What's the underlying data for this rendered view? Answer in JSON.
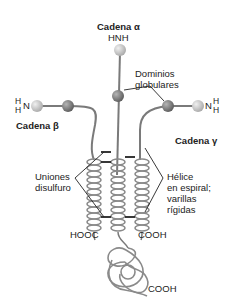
{
  "diagram": {
    "chains": {
      "alpha": {
        "label": "Cadena α",
        "terminal": "HNH"
      },
      "beta": {
        "label": "Cadena β",
        "terminal_h1": "H",
        "terminal_n": "N",
        "terminal_h2": "H"
      },
      "gamma": {
        "label": "Cadena γ",
        "terminal_n": "N",
        "terminal_h1": "H",
        "terminal_h2": "H"
      }
    },
    "annotations": {
      "globular": {
        "line1": "Dominios",
        "line2": "globulares"
      },
      "disulfide": {
        "line1": "Uniones",
        "line2": "disulfuro"
      },
      "helix": {
        "line1": "Hélice",
        "line2": "en espiral;",
        "line3": "varillas",
        "line4": "rígidas"
      }
    },
    "termini": {
      "left": "HOOC",
      "right": "COOH",
      "bottom": "COOH"
    },
    "colors": {
      "line": "#7a7a7a",
      "sphere_light": "#c8c8c8",
      "sphere_dark": "#7d7d7d",
      "text": "#222222"
    }
  }
}
